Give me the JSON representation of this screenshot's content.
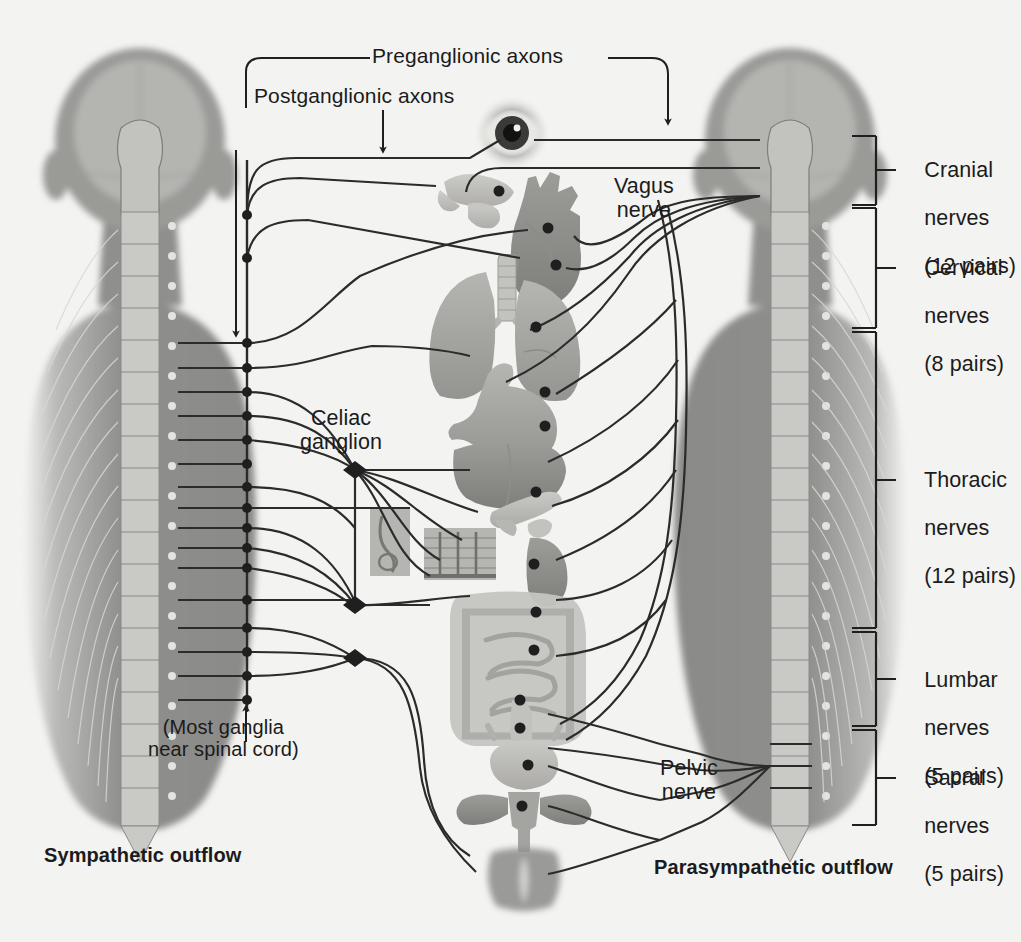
{
  "figure": {
    "background_color": "#f3f3f1",
    "ink_color": "#2b2b2b"
  },
  "annotations": {
    "preganglionic": "Preganglionic axons",
    "postganglionic": "Postganglionic axons",
    "vagus_nerve": "Vagus\nnerve",
    "pelvic_nerve": "Pelvic\nnerve",
    "celiac_ganglion": "Celiac\nganglion",
    "most_ganglia_note": "(Most ganglia\nnear spinal cord)"
  },
  "footers": {
    "left": "Sympathetic outflow",
    "right": "Parasympathetic outflow"
  },
  "spinal_segments": [
    {
      "id": "cranial",
      "name": "Cranial",
      "line2": "nerves",
      "pairs": "(12 pairs)",
      "top": 136,
      "bottom": 205
    },
    {
      "id": "cervical",
      "name": "Cervical",
      "line2": "nerves",
      "pairs": "(8 pairs)",
      "top": 208,
      "bottom": 328
    },
    {
      "id": "thoracic",
      "name": "Thoracic",
      "line2": "nerves",
      "pairs": "(12 pairs)",
      "top": 332,
      "bottom": 628
    },
    {
      "id": "lumbar",
      "name": "Lumbar",
      "line2": "nerves",
      "pairs": "(5 pairs)",
      "top": 632,
      "bottom": 726
    },
    {
      "id": "sacral",
      "name": "Sacral",
      "line2": "nerves",
      "pairs": "(5 pairs)",
      "top": 730,
      "bottom": 825
    }
  ],
  "organs": [
    {
      "id": "eye",
      "label": "eye",
      "cx": 512,
      "cy": 133
    },
    {
      "id": "salivary-glands",
      "label": "salivary glands",
      "cx": 480,
      "cy": 193
    },
    {
      "id": "heart",
      "label": "heart",
      "cx": 551,
      "cy": 230
    },
    {
      "id": "lungs",
      "label": "lungs",
      "cx": 510,
      "cy": 310
    },
    {
      "id": "stomach",
      "label": "stomach",
      "cx": 508,
      "cy": 410
    },
    {
      "id": "liver",
      "label": "liver",
      "cx": 500,
      "cy": 470
    },
    {
      "id": "pancreas",
      "label": "pancreas",
      "cx": 520,
      "cy": 512
    },
    {
      "id": "adrenal-kidney",
      "label": "adrenal gland / kidney",
      "cx": 528,
      "cy": 560
    },
    {
      "id": "skin-inset-left",
      "label": "skin (sweat gland)",
      "cx": 388,
      "cy": 545
    },
    {
      "id": "skin-inset-right",
      "label": "skin (hair follicles)",
      "cx": 460,
      "cy": 552
    },
    {
      "id": "intestines",
      "label": "intestines",
      "cx": 515,
      "cy": 650
    },
    {
      "id": "rectum",
      "label": "rectum",
      "cx": 520,
      "cy": 712
    },
    {
      "id": "bladder",
      "label": "bladder",
      "cx": 524,
      "cy": 762
    },
    {
      "id": "reproductive",
      "label": "reproductive organs",
      "cx": 524,
      "cy": 806
    },
    {
      "id": "genitals",
      "label": "genitals",
      "cx": 524,
      "cy": 872
    }
  ],
  "ganglia": {
    "chain_label": "sympathetic chain ganglia",
    "prevertebral_label": "prevertebral ganglia",
    "chain_x": 247,
    "chain_ys": [
      215,
      258,
      343,
      368,
      392,
      416,
      440,
      464,
      487,
      508,
      528,
      548,
      568,
      600,
      628,
      652,
      676,
      700
    ],
    "prevertebral_x": 355,
    "prevertebral_ys": [
      470,
      605,
      658
    ]
  },
  "bodies": [
    {
      "id": "sympathetic-body",
      "side": "left",
      "center_x": 140
    },
    {
      "id": "parasympathetic-body",
      "side": "right",
      "center_x": 790
    }
  ]
}
